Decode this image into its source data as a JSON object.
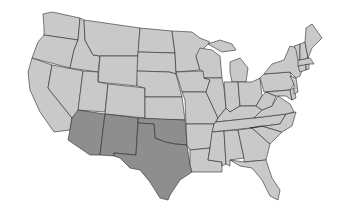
{
  "map": {
    "title": "United States map with Southwest region highlighted",
    "colors": {
      "base": "#c9c9c9",
      "highlight": "#8e8e8e",
      "border": "#2a2a2a",
      "background": "#ffffff"
    },
    "highlighted_region": "Southwest",
    "highlighted_states": [
      "Arizona",
      "New Mexico",
      "Texas",
      "Oklahoma"
    ],
    "states_shown": [
      "Washington",
      "Oregon",
      "California",
      "Idaho",
      "Nevada",
      "Montana",
      "Wyoming",
      "Utah",
      "Colorado",
      "Arizona",
      "New Mexico",
      "North Dakota",
      "South Dakota",
      "Nebraska",
      "Kansas",
      "Oklahoma",
      "Texas",
      "Minnesota",
      "Iowa",
      "Missouri",
      "Arkansas",
      "Louisiana",
      "Wisconsin",
      "Illinois",
      "Michigan",
      "Indiana",
      "Ohio",
      "Kentucky",
      "Tennessee",
      "Mississippi",
      "Alabama",
      "Georgia",
      "Florida",
      "South Carolina",
      "North Carolina",
      "Virginia",
      "West Virginia",
      "Pennsylvania",
      "New York",
      "Maryland",
      "Delaware",
      "New Jersey",
      "Connecticut",
      "Rhode Island",
      "Massachusetts",
      "Vermont",
      "New Hampshire",
      "Maine"
    ]
  }
}
